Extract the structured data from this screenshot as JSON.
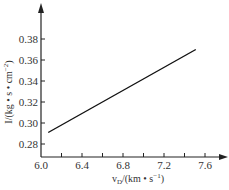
{
  "chart_data": {
    "type": "line",
    "title": "",
    "xlabel": "v_D/(km • s⁻¹)",
    "ylabel": "I/(kg • s • cm⁻²)",
    "xlim": [
      6.0,
      7.75
    ],
    "ylim": [
      0.272,
      0.4
    ],
    "x_ticks": [
      "6.0",
      "6.4",
      "6.8",
      "7.2",
      "7.6"
    ],
    "x_tick_values": [
      6.0,
      6.4,
      6.8,
      7.2,
      7.6
    ],
    "y_ticks": [
      "0.28",
      "0.30",
      "0.32",
      "0.34",
      "0.36",
      "0.38"
    ],
    "y_tick_values": [
      0.28,
      0.3,
      0.32,
      0.34,
      0.36,
      0.38
    ],
    "grid": false,
    "legend": null,
    "series": [
      {
        "name": "I vs v_D",
        "x": [
          6.07,
          7.51
        ],
        "y": [
          0.291,
          0.37
        ]
      }
    ]
  },
  "labels": {
    "xlabel_main": "v",
    "xlabel_sub": "D",
    "xlabel_rest": "/(km • s",
    "xlabel_sup": "−1",
    "xlabel_close": ")",
    "ylabel_main": "I/(kg • s • cm",
    "ylabel_sup": "−2",
    "ylabel_close": ")"
  }
}
